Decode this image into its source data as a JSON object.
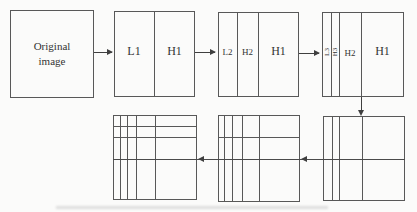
{
  "diagram": {
    "original_box": {
      "line1": "Original",
      "line2": "image"
    },
    "stages": [
      {
        "name": "column-level-1",
        "labels": [
          "L1",
          "H1"
        ]
      },
      {
        "name": "column-level-2",
        "labels": [
          "L2",
          "H2",
          "H1"
        ]
      },
      {
        "name": "column-level-3",
        "labels": [
          "L3",
          "H3",
          "H2",
          "H1"
        ]
      }
    ],
    "row_stages": [
      {
        "name": "row-level-1-grid"
      },
      {
        "name": "row-level-2-grid"
      },
      {
        "name": "row-level-3-grid"
      }
    ]
  },
  "colors": {
    "background": "#fbfbfa",
    "line": "#585858",
    "arrow": "#3f3f3f",
    "text": "#333333"
  }
}
